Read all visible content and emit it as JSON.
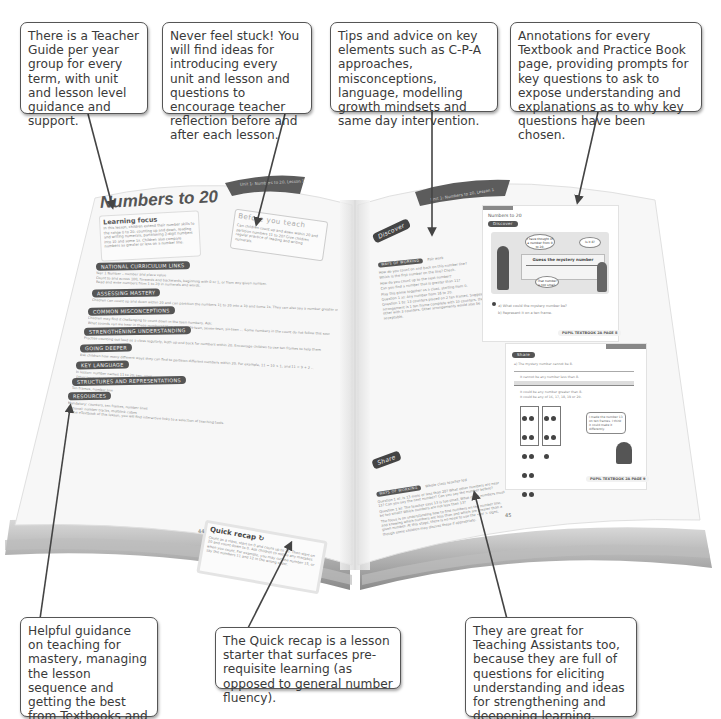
{
  "callouts": {
    "top": [
      {
        "id": "teacher-guide",
        "text": "There is a Teacher Guide per year group for every term, with unit and lesson level guidance and support."
      },
      {
        "id": "never-stuck",
        "text": "Never feel stuck! You will find ideas for introducing every unit and lesson and questions to encourage teacher reflection before and after each lesson."
      },
      {
        "id": "tips-advice",
        "text": "Tips and advice on key elements such as C-P-A approaches, misconceptions, language, modelling growth mindsets and same day intervention."
      },
      {
        "id": "annotations",
        "text": "Annotations for every Textbook and Practice Book page, providing prompts for key questions to ask to expose understanding and explanations as to why key questions have been chosen."
      }
    ],
    "bottom": [
      {
        "id": "helpful-guidance",
        "text": "Helpful guidance on teaching for mastery, managing the lesson sequence and getting the best from Textbooks and Practice Books."
      },
      {
        "id": "quick-recap-info",
        "text": "The Quick recap is a lesson starter that surfaces pre-requisite learning (as opposed to general number fluency)."
      },
      {
        "id": "teaching-assistants",
        "text": "They are great for Teaching Assistants too, because they are full of questions for eliciting understanding and ideas for strengthening and deepening learning."
      }
    ]
  },
  "book": {
    "left_page": {
      "header_strip": "Unit 1: Numbers to 20, Lesson 1",
      "title": "Numbers to 20",
      "learning_focus": {
        "heading": "Learning focus",
        "body": "In this lesson, children extend their number skills to the range 0 to 20: counting up and down, reading and writing numerals, partitioning 2-digit numbers into 10 and some 1s. Children also compare numbers as greater or less on a number line."
      },
      "before_you_teach": {
        "heading": "Before you teach",
        "body": "Can children count up and down within 20 and partition numbers 11 to 20? Give children regular practice of reading and writing numerals."
      },
      "sections": [
        {
          "label": "NATIONAL CURRICULUM LINKS",
          "lines": [
            "Year 1 Number – number and place value",
            "Count to and across 100, forwards and backwards, beginning with 0 or 1, or from any given number.",
            "Read and write numbers from 1 to 20 in numerals and words."
          ]
        },
        {
          "label": "ASSESSING MASTERY",
          "lines": [
            "Children can count up and down within 20 and can partition the numbers 11 to 20 into a 10 and some 1s. They can also say a number greater or less than a given number."
          ]
        },
        {
          "label": "COMMON MISCONCEPTIONS",
          "lines": [
            "Children may find it challenging to count down in the teen numbers. Ask:",
            "What sounds can we hear in these numbers? How many eight-teen, seven-teen, six-teen … Some numbers in the count do not follow this sound pattern."
          ]
        },
        {
          "label": "STRENGTHENING UNDERSTANDING",
          "lines": [
            "Practise counting out loud as a class regularly, both up and back for numbers within 20. Encourage children to use ten frames to help them recognise numbers within 20."
          ]
        },
        {
          "label": "GOING DEEPER",
          "lines": [
            "Ask children how many different ways they can find to partition different numbers within 20. For example, 11 = 10 + 1, and 11 = 9 + 2 …"
          ]
        },
        {
          "label": "KEY LANGUAGE",
          "lines": [
            "In lesson: number names 11 to 20; ten, ones",
            "Other language to be used by the teacher: partition"
          ]
        },
        {
          "label": "STRUCTURES AND REPRESENTATIONS",
          "lines": [
            "Ten frames, number line"
          ]
        },
        {
          "label": "RESOURCES",
          "lines": [
            "Mandatory: counters, ten frames, number lines",
            "Optional: number tracks, multilink cubes",
            "In the eTextbook of this lesson, you will find interactive links to a selection of teaching tools."
          ]
        }
      ],
      "quick_recap": {
        "heading": "Quick recap",
        "body": "Count as a class, start on 0 and count up to 20. Then start on 20 and count down to 0. Ask children to notice any mistakes when you count. For example, you may cut the number 15, or say the numbers 11 and 12 in the wrong order."
      },
      "page_number": "44"
    },
    "right_page": {
      "header_strip": "Unit 1: Numbers to 20, Lesson 1",
      "discover": {
        "label": "Discover",
        "tag": "WAYS OF WORKING",
        "tag_value": "Pair work",
        "lines": [
          "How do you count on and back on this number line?",
          "Which is the first number on the line? Check.",
          "How do you count up to the next number?",
          "Can you find a number that is greater than 11?",
          "Play this game together as a class, starting from 0.",
          "Question 1 a): Any number from 16 to 20.",
          "Question 1 b): 13 counters placed on 2 ten frames. Suggested arrangement is 1 ten frame complete with 10 counters, the other with 3 counters. Other arrangements would also be acceptable."
        ]
      },
      "share": {
        "label": "Share",
        "tag": "WAYS OF WORKING",
        "tag_value": "Whole class teacher led",
        "lines": [
          "Question 1 a): Is 13 more or less than 20? What other numbers are near 13? Can you say the next number? Can you say the number before?",
          "Question 1 b): The teacher says 13 is too small. What other numbers must be too small? Which numbers are not less than 13?",
          "The focus is on understanding how to find numbers on the number line, and knowing which numbers are less than and which are greater than a given number. At this stage, there is no need to use the < or > signs, though some children may discuss these if appropriate."
        ]
      },
      "inset_top": {
        "title": "Numbers to 20",
        "tag": "Discover",
        "banner": "Guess the mystery number",
        "bubble1": "I have thought of a number from 0 to 20.",
        "bubble2": "Is it 8?",
        "bubble3": "That number is too small.",
        "q_a": "a) What could the mystery number be?",
        "q_b": "b) Represent it on a ten frame.",
        "footer": "PUPIL TEXTBOOK 2A  PAGE 8"
      },
      "inset_bottom": {
        "tag": "Share",
        "q_a": "a) The mystery number cannot be 8.",
        "line2": "It cannot be any number less than 8.",
        "line3": "It could be any number greater than 8.",
        "line4": "It could be any of 16, 17, 18, 19 or 20.",
        "bubble": "I made the number 13 on ten frames. I think it could make it differently.",
        "footer": "PUPIL TEXTBOOK 2A  PAGE 9"
      },
      "page_number": "45"
    }
  }
}
